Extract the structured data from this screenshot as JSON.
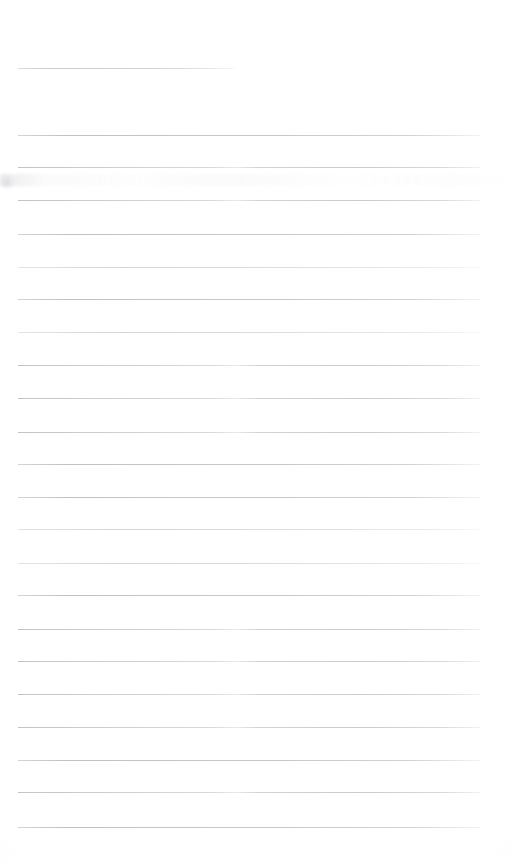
{
  "document": {
    "kind": "scanned-blank-ruled-page",
    "title": "Blank Ruled Page",
    "page_width": 512,
    "page_height": 863,
    "background_color": "#fefefe",
    "text_content": "",
    "has_text": false,
    "has_handwriting": false
  },
  "ruling": {
    "rule_color": "#d6d7db",
    "rule_thickness_px": 1,
    "line_spacing_px": 32.4,
    "left_margin_px": 18,
    "right_edge_px": 480,
    "rule_count_total": 24,
    "full_width_rule_count": 23,
    "short_rule_count": 1
  },
  "rules": [
    {
      "name": "rule-01-short",
      "y": 68,
      "x": 18,
      "width": 217,
      "style": "short"
    },
    {
      "name": "rule-02",
      "y": 135,
      "x": 18,
      "width": 462,
      "style": "even-ink"
    },
    {
      "name": "rule-03",
      "y": 167,
      "x": 18,
      "width": 462,
      "style": "faded-mid"
    },
    {
      "name": "rule-04",
      "y": 200,
      "x": 18,
      "width": 462,
      "style": "faded-mid"
    },
    {
      "name": "rule-05",
      "y": 234,
      "x": 18,
      "width": 462,
      "style": "even-ink"
    },
    {
      "name": "rule-06",
      "y": 267,
      "x": 18,
      "width": 462,
      "style": "light"
    },
    {
      "name": "rule-07",
      "y": 299,
      "x": 18,
      "width": 462,
      "style": "even-ink"
    },
    {
      "name": "rule-08",
      "y": 332,
      "x": 18,
      "width": 462,
      "style": "light"
    },
    {
      "name": "rule-09",
      "y": 365,
      "x": 18,
      "width": 462,
      "style": "faded-mid"
    },
    {
      "name": "rule-10",
      "y": 398,
      "x": 18,
      "width": 462,
      "style": "faded-mid"
    },
    {
      "name": "rule-11",
      "y": 432,
      "x": 18,
      "width": 462,
      "style": "faded-mid"
    },
    {
      "name": "rule-12",
      "y": 464,
      "x": 18,
      "width": 462,
      "style": "even-ink"
    },
    {
      "name": "rule-13",
      "y": 497,
      "x": 18,
      "width": 462,
      "style": "even-ink"
    },
    {
      "name": "rule-14",
      "y": 529,
      "x": 18,
      "width": 462,
      "style": "light"
    },
    {
      "name": "rule-15",
      "y": 563,
      "x": 18,
      "width": 462,
      "style": "light"
    },
    {
      "name": "rule-16",
      "y": 595,
      "x": 18,
      "width": 462,
      "style": "even-ink"
    },
    {
      "name": "rule-17",
      "y": 629,
      "x": 18,
      "width": 462,
      "style": "faded-mid"
    },
    {
      "name": "rule-18",
      "y": 661,
      "x": 18,
      "width": 462,
      "style": "faded-mid"
    },
    {
      "name": "rule-19",
      "y": 694,
      "x": 18,
      "width": 462,
      "style": "faded-mid"
    },
    {
      "name": "rule-20",
      "y": 727,
      "x": 18,
      "width": 462,
      "style": "faded-mid"
    },
    {
      "name": "rule-21",
      "y": 760,
      "x": 18,
      "width": 462,
      "style": "even-ink"
    },
    {
      "name": "rule-22",
      "y": 792,
      "x": 18,
      "width": 462,
      "style": "faded-mid"
    },
    {
      "name": "rule-23",
      "y": 827,
      "x": 18,
      "width": 462,
      "style": "even-ink"
    }
  ],
  "artifacts": {
    "smudge_band": {
      "name": "scanner-smudge-band",
      "y": 174,
      "height": 12
    },
    "corner_smudge": {
      "name": "corner-smudge",
      "x": 0,
      "y": 176,
      "size": 14
    }
  }
}
